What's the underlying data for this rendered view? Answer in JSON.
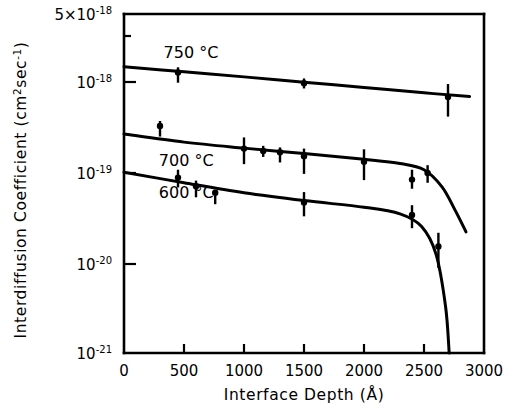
{
  "chart_data": {
    "type": "line",
    "title": "",
    "xlabel": "Interface Depth (Å)",
    "ylabel": "Interdiffusion Coefficient (cm²sec⁻¹)",
    "ylabel_main": "Interdiffusion Coefficient (cm",
    "ylabel_sup1": "2",
    "ylabel_mid": "sec",
    "ylabel_sup2": "-1",
    "ylabel_end": ")",
    "xlabel_main": "Interface Depth (Å)",
    "xlim": [
      0,
      3000
    ],
    "ylim": [
      1e-21,
      5e-18
    ],
    "yscale": "log",
    "grid": false,
    "legend_position": "inline-annotations",
    "xticks": [
      0,
      500,
      1000,
      1500,
      2000,
      2500,
      3000
    ],
    "xtick_labels": [
      "0",
      "500",
      "1000",
      "1500",
      "2000",
      "2500",
      "3000"
    ],
    "yticks": [
      5e-18,
      1e-18,
      1e-19,
      1e-20,
      1e-21
    ],
    "ytick_labels": [
      "5×10-18",
      "10-18",
      "10-19",
      "10-20",
      "10-21"
    ],
    "ytick_mantissas": [
      "5×10",
      "10",
      "10",
      "10",
      "10"
    ],
    "ytick_exponents": [
      "-18",
      "-18",
      "-19",
      "-20",
      "-21"
    ],
    "series": [
      {
        "name": "750 °C",
        "label": "750 °C",
        "label_x": 330,
        "label_y": 1.9e-18,
        "points": [
          {
            "x": 450,
            "y": 1.15e-18,
            "err_lo": 2.6e-19,
            "err_hi": 1.6e-19
          },
          {
            "x": 1500,
            "y": 8.8e-19,
            "err_lo": 1.1e-19,
            "err_hi": 1.1e-19
          },
          {
            "x": 2700,
            "y": 6.2e-19,
            "err_lo": 2.4e-19,
            "err_hi": 2.4e-19
          }
        ],
        "fit": [
          {
            "x": 0,
            "y": 1.33e-18
          },
          {
            "x": 500,
            "y": 1.17e-18
          },
          {
            "x": 1000,
            "y": 1.03e-18
          },
          {
            "x": 1500,
            "y": 9e-19
          },
          {
            "x": 2000,
            "y": 7.9e-19
          },
          {
            "x": 2500,
            "y": 6.9e-19
          },
          {
            "x": 2880,
            "y": 6.3e-19
          }
        ]
      },
      {
        "name": "700 °C",
        "label": "700 °C",
        "label_x": 290,
        "label_y": 1.25e-19,
        "points": [
          {
            "x": 300,
            "y": 3e-19,
            "err_lo": 7e-20,
            "err_hi": 4e-20
          },
          {
            "x": 1000,
            "y": 1.7e-19,
            "err_lo": 5.5e-20,
            "err_hi": 5.5e-20
          },
          {
            "x": 1160,
            "y": 1.6e-19,
            "err_lo": 2.2e-20,
            "err_hi": 2.2e-20
          },
          {
            "x": 1300,
            "y": 1.55e-19,
            "err_lo": 3.5e-20,
            "err_hi": 2e-20
          },
          {
            "x": 1500,
            "y": 1.4e-19,
            "err_lo": 5e-20,
            "err_hi": 3e-20
          },
          {
            "x": 2000,
            "y": 1.22e-19,
            "err_lo": 4.5e-20,
            "err_hi": 4.5e-20
          },
          {
            "x": 2400,
            "y": 7.8e-20,
            "err_lo": 1.6e-20,
            "err_hi": 2.2e-20
          },
          {
            "x": 2530,
            "y": 9.2e-20,
            "err_lo": 2e-20,
            "err_hi": 2e-20
          }
        ],
        "fit": [
          {
            "x": 0,
            "y": 2.45e-19
          },
          {
            "x": 500,
            "y": 2e-19
          },
          {
            "x": 1000,
            "y": 1.72e-19
          },
          {
            "x": 1500,
            "y": 1.5e-19
          },
          {
            "x": 2000,
            "y": 1.3e-19
          },
          {
            "x": 2300,
            "y": 1.17e-19
          },
          {
            "x": 2500,
            "y": 1e-19
          },
          {
            "x": 2650,
            "y": 6.5e-20
          },
          {
            "x": 2760,
            "y": 3.6e-20
          },
          {
            "x": 2850,
            "y": 2.1e-20
          }
        ]
      },
      {
        "name": "600 °C",
        "label": "600 °C",
        "label_x": 290,
        "label_y": 5.6e-20,
        "points": [
          {
            "x": 450,
            "y": 8.2e-20,
            "err_lo": 1.8e-20,
            "err_hi": 1.8e-20
          },
          {
            "x": 600,
            "y": 6.6e-20,
            "err_lo": 1.6e-20,
            "err_hi": 1e-20
          },
          {
            "x": 760,
            "y": 5.6e-20,
            "err_lo": 1.4e-20,
            "err_hi": 0.0
          },
          {
            "x": 1500,
            "y": 4.4e-20,
            "err_lo": 1.3e-20,
            "err_hi": 1.3e-20
          },
          {
            "x": 2400,
            "y": 3.2e-20,
            "err_lo": 9e-21,
            "err_hi": 9e-21
          },
          {
            "x": 2620,
            "y": 1.45e-20,
            "err_lo": 6e-21,
            "err_hi": 6e-21
          }
        ],
        "fit": [
          {
            "x": 0,
            "y": 9.4e-20
          },
          {
            "x": 500,
            "y": 7.2e-20
          },
          {
            "x": 1000,
            "y": 5.6e-20
          },
          {
            "x": 1500,
            "y": 4.6e-20
          },
          {
            "x": 2000,
            "y": 3.9e-20
          },
          {
            "x": 2300,
            "y": 3.3e-20
          },
          {
            "x": 2480,
            "y": 2.4e-20
          },
          {
            "x": 2600,
            "y": 1.2e-20
          },
          {
            "x": 2680,
            "y": 3.2e-21
          },
          {
            "x": 2710,
            "y": 1e-21
          }
        ]
      }
    ]
  }
}
